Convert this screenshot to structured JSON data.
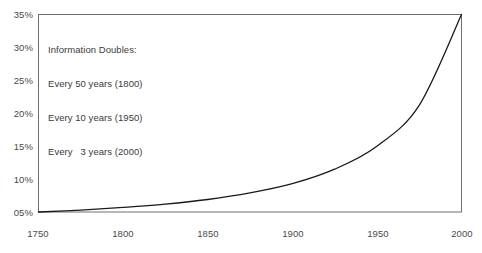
{
  "chart_data": {
    "type": "line",
    "title": "",
    "subtitle": "",
    "xlabel": "",
    "ylabel": "",
    "xlim": [
      1750,
      2000
    ],
    "ylim": [
      5,
      35
    ],
    "grid": false,
    "legend": null,
    "x_tick_labels": [
      "1750",
      "1800",
      "1850",
      "1900",
      "1950",
      "2000"
    ],
    "x_ticks": [
      1750,
      1800,
      1850,
      1900,
      1950,
      2000
    ],
    "y_tick_labels": [
      "35%",
      "30%",
      "25%",
      "20%",
      "15%",
      "10%",
      "05%"
    ],
    "y_ticks": [
      35,
      30,
      25,
      20,
      15,
      10,
      5
    ],
    "series": [
      {
        "name": "Information growth",
        "color": "#1a1a1a",
        "x": [
          1750,
          1775,
          1800,
          1825,
          1850,
          1875,
          1900,
          1925,
          1950,
          1975,
          2000
        ],
        "y": [
          5.0,
          5.3,
          5.7,
          6.2,
          6.9,
          7.9,
          9.3,
          11.5,
          15.0,
          21.2,
          35.0
        ]
      }
    ],
    "annotations": [
      {
        "name": "information-doubles-note",
        "lines": [
          "Information Doubles:",
          "Every 50 years (1800)",
          "Every 10 years (1950)",
          "Every   3 years (2000)"
        ]
      }
    ],
    "colors": {
      "curve": "#1a1a1a",
      "frame": "#6e6e6e",
      "text": "#4a4a4a",
      "background": "#ffffff"
    }
  }
}
